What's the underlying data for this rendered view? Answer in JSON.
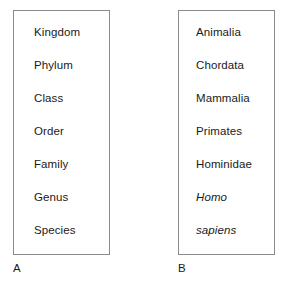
{
  "figure": {
    "background_color": "#ffffff",
    "text_color": "#1a1a1a",
    "border_color": "#8a8a8a"
  },
  "panels": [
    {
      "id": "a",
      "caption": "A",
      "rows": [
        {
          "text": "Kingdom",
          "italic": false
        },
        {
          "text": "Phylum",
          "italic": false
        },
        {
          "text": "Class",
          "italic": false
        },
        {
          "text": "Order",
          "italic": false
        },
        {
          "text": "Family",
          "italic": false
        },
        {
          "text": "Genus",
          "italic": false
        },
        {
          "text": "Species",
          "italic": false
        }
      ]
    },
    {
      "id": "b",
      "caption": "B",
      "rows": [
        {
          "text": "Animalia",
          "italic": false
        },
        {
          "text": "Chordata",
          "italic": false
        },
        {
          "text": "Mammalia",
          "italic": false
        },
        {
          "text": "Primates",
          "italic": false
        },
        {
          "text": "Hominidae",
          "italic": false
        },
        {
          "text": "Homo",
          "italic": true
        },
        {
          "text": "sapiens",
          "italic": true
        }
      ]
    }
  ]
}
